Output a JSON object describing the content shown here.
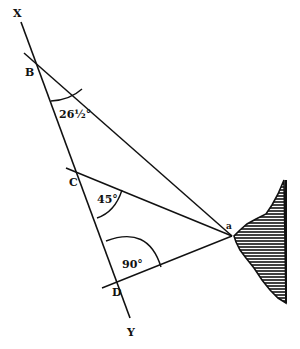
{
  "figure": {
    "colors": {
      "ink": "#111111",
      "background": "#ffffff"
    }
  },
  "points": {
    "X": {
      "label": "X"
    },
    "Y": {
      "label": "Y"
    },
    "B": {
      "label": "B"
    },
    "C": {
      "label": "C"
    },
    "D": {
      "label": "D"
    },
    "A": {
      "label": "a"
    }
  },
  "angles": {
    "at_B": "26½°",
    "at_C": "45°",
    "at_D": "90°"
  }
}
